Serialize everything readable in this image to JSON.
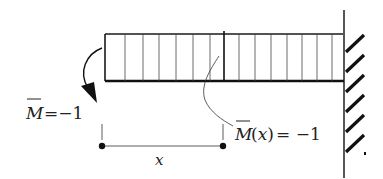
{
  "diagram": {
    "type": "cantilever beam with unit moment",
    "labels": {
      "applied_moment_symbol": "M",
      "applied_moment_value": "=−1",
      "internal_moment_symbol": "M",
      "internal_moment_arg": "(x)",
      "internal_moment_value": " = −1",
      "distance_label": "x"
    },
    "colors": {
      "stroke": "#1a1a1a",
      "hatch": "#111111",
      "background": "#ffffff"
    },
    "beam": {
      "left": 105,
      "right": 343,
      "top": 34,
      "bottom": 81,
      "section_cut_x": 224,
      "hatch_lines_x": [
        125,
        143,
        159,
        176,
        193,
        210,
        240,
        256,
        271,
        287,
        302,
        317,
        332
      ]
    },
    "support": {
      "type": "fixed wall",
      "x": 344
    }
  }
}
